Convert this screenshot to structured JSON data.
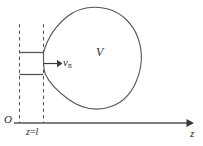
{
  "figure": {
    "background_color": "#ffffff",
    "stroke_color": "#555555",
    "text_color": "#2b2b2b",
    "axis": {
      "name": "z-axis",
      "origin_label": "O",
      "axis_label": "z",
      "tick_label": "z=l",
      "tick_label_parts": {
        "variable": "z",
        "equals": "=",
        "value": "l"
      }
    },
    "region": {
      "name": "control-volume",
      "label": "V"
    },
    "flow": {
      "name": "normal-velocity",
      "label": "v",
      "subscript": "n",
      "direction": "right"
    },
    "guides": {
      "dashed_line_left": "dashed-guide-left",
      "dashed_line_right": "dashed-guide-right",
      "tube_wall_top": "tube-wall-top",
      "tube_wall_bottom": "tube-wall-bottom"
    }
  }
}
